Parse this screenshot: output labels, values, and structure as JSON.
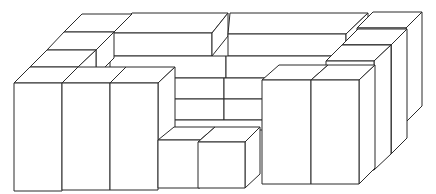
{
  "diagram": {
    "stroke_color": "#2a2a2a",
    "background_color": "#ffffff",
    "groups": [
      {
        "name": "back-top-slabs",
        "count": 2
      },
      {
        "name": "middle-slabs",
        "count": 2
      },
      {
        "name": "center-small-blocks",
        "count": 4
      },
      {
        "name": "left-stacked-blocks",
        "count": 3
      },
      {
        "name": "left-tall-boxes",
        "count": 3
      },
      {
        "name": "right-stacked-tall-boxes",
        "count": 3
      },
      {
        "name": "right-front-tall-boxes",
        "count": 2
      },
      {
        "name": "front-small-cubes",
        "count": 2
      }
    ]
  }
}
